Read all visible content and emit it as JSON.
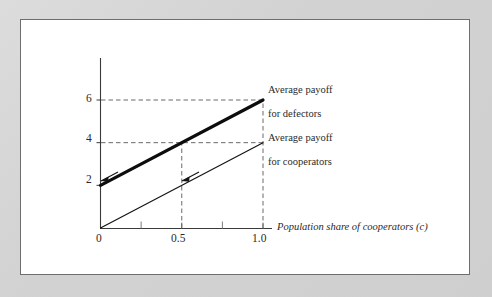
{
  "figure": {
    "background_color": "#d5d5d5",
    "panel_color": "#ffffff",
    "border_color": "#6e6e6e"
  },
  "chart_data": {
    "type": "line",
    "title": "",
    "subtitle": "",
    "xlabel": "Population share of cooperators (c)",
    "ylabel": "",
    "xlim": [
      0,
      1.0
    ],
    "ylim": [
      0,
      7
    ],
    "grid": "dashed-reference-lines-only",
    "legend": "inline-annotations-right",
    "x": [
      0,
      1.0
    ],
    "series": [
      {
        "name": "Average payoff for defectors",
        "values": [
          2,
          6
        ],
        "style": "thick-solid",
        "color": "#111111",
        "linewidth": 3.2
      },
      {
        "name": "Average payoff for cooperators",
        "values": [
          0,
          4
        ],
        "style": "thin-solid",
        "color": "#111111",
        "linewidth": 1.2
      }
    ],
    "x_ticks": [
      0,
      0.25,
      0.5,
      0.75,
      1.0
    ],
    "x_tick_labels": [
      "0",
      "",
      "0.5",
      "",
      "1.0"
    ],
    "y_ticks": [
      0,
      2,
      4,
      6
    ],
    "y_tick_labels": [
      "0",
      "2",
      "4",
      "6"
    ],
    "reference_lines": [
      {
        "type": "horizontal",
        "value": 6,
        "from_x": 0,
        "to_x": 1.0,
        "style": "dashed"
      },
      {
        "type": "horizontal",
        "value": 4,
        "from_x": 0,
        "to_x": 1.0,
        "style": "dashed"
      },
      {
        "type": "vertical",
        "value": 1.0,
        "from_y": 0,
        "to_y": 6,
        "style": "dashed"
      },
      {
        "type": "vertical",
        "value": 0.5,
        "from_y": 0,
        "to_y": 4,
        "style": "dashed"
      }
    ],
    "annotations": [
      {
        "name": "defectors-label",
        "line1": "Average payoff",
        "line2": "for defectors",
        "points_to": {
          "x": 0.0,
          "y": 2.0
        }
      },
      {
        "name": "cooperators-label",
        "line1": "Average payoff",
        "line2": "for cooperators",
        "points_to": {
          "x": 0.5,
          "y": 2.0
        }
      }
    ]
  },
  "axes": {
    "x_tick_labels": {
      "zero": "0",
      "half": "0.5",
      "one": "1.0"
    },
    "y_tick_labels": {
      "zero": "0",
      "two": "2",
      "four": "4",
      "six": "6"
    },
    "x_axis_title": "Population share of cooperators (c)"
  },
  "annotations": {
    "defectors": {
      "line1": "Average payoff",
      "line2": "for defectors"
    },
    "cooperators": {
      "line1": "Average payoff",
      "line2": "for cooperators"
    }
  }
}
